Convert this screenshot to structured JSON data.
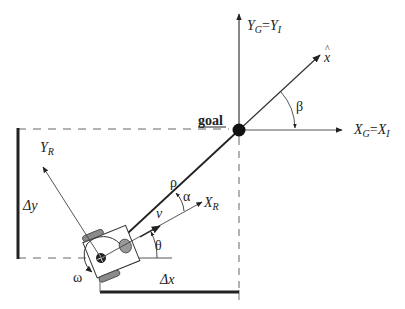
{
  "diagram": {
    "labels": {
      "y_global": {
        "main": "Y",
        "sub1": "G",
        "eq": "=",
        "main2": "Y",
        "sub2": "I"
      },
      "x_global": {
        "main": "X",
        "sub1": "G",
        "eq": "=",
        "main2": "X",
        "sub2": "I"
      },
      "x_hat": "x",
      "x_hat_accent": "^",
      "beta": "β",
      "goal": "goal",
      "y_robot": {
        "main": "Y",
        "sub": "R"
      },
      "x_robot": {
        "main": "X",
        "sub": "R"
      },
      "rho": "ρ",
      "alpha": "α",
      "nu": "v",
      "theta": "θ",
      "omega": "ω",
      "delta_y": "Δy",
      "delta_x": "Δx"
    },
    "colors": {
      "line": "#222222",
      "thin_line": "#555555",
      "dashed": "#666666",
      "wheel": "#8a8a8a",
      "goal_dot": "#111111"
    }
  }
}
